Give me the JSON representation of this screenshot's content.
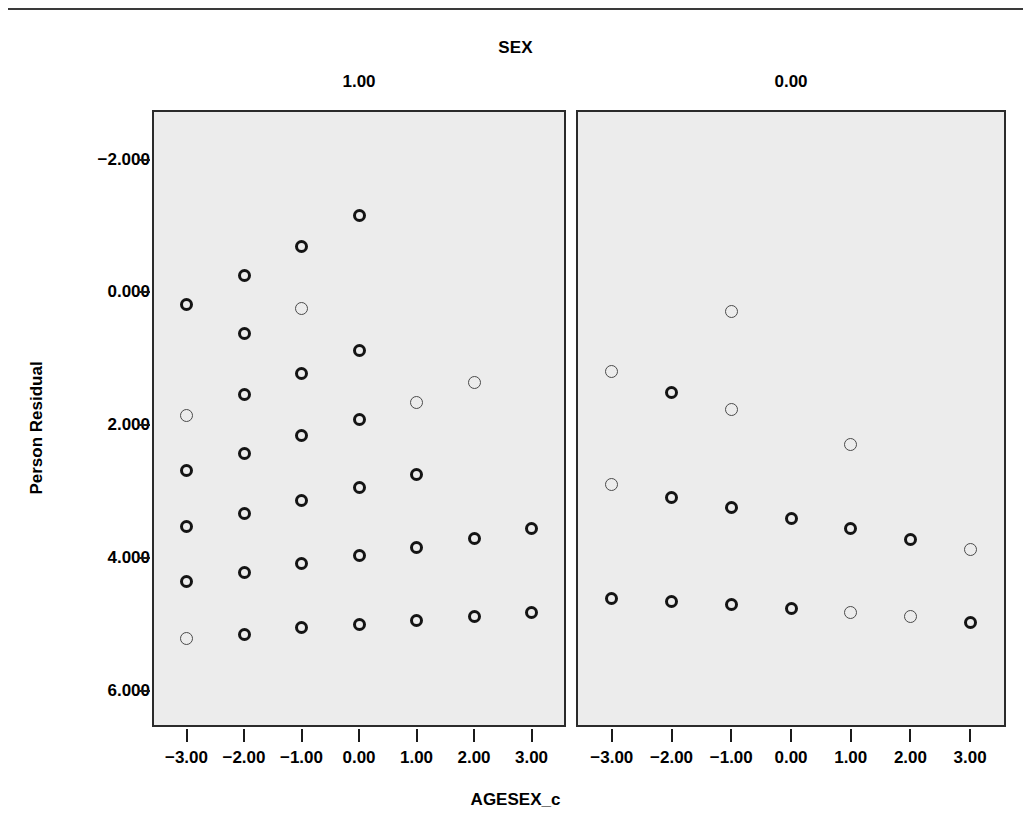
{
  "figure": {
    "title": "SEX",
    "y_axis_title": "Person Residual",
    "x_axis_title": "AGESEX_c",
    "panel_labels": [
      "1.00",
      "0.00"
    ],
    "y_tick_labels": [
      "6.000",
      "4.000",
      "2.000",
      "0.000",
      "−2.000"
    ],
    "x_tick_labels": [
      "−3.00",
      "−2.00",
      "−1.00",
      "0.00",
      "1.00",
      "2.00",
      "3.00"
    ],
    "panel_background": "#ececec",
    "marker_color": "#141414",
    "page_background": "#ffffff"
  },
  "chart_data": {
    "type": "scatter",
    "title": "SEX",
    "xlabel": "AGESEX_c",
    "ylabel": "Person Residual",
    "grid": false,
    "legend": null,
    "xlim": [
      -3.6,
      3.6
    ],
    "ylim": [
      -2.55,
      6.75
    ],
    "x_ticks": [
      -3,
      -2,
      -1,
      0,
      1,
      2,
      3
    ],
    "y_ticks": [
      -2,
      0,
      2,
      4,
      6
    ],
    "facet_variable": "SEX",
    "panels": [
      {
        "label": "1.00",
        "points": [
          {
            "x": -3,
            "y": 3.82,
            "weight": "heavy"
          },
          {
            "x": -3,
            "y": 2.14,
            "weight": "light"
          },
          {
            "x": -3,
            "y": 1.32,
            "weight": "heavy"
          },
          {
            "x": -3,
            "y": 0.47,
            "weight": "heavy"
          },
          {
            "x": -3,
            "y": -0.36,
            "weight": "heavy"
          },
          {
            "x": -3,
            "y": -1.22,
            "weight": "light"
          },
          {
            "x": -2,
            "y": 4.26,
            "weight": "heavy"
          },
          {
            "x": -2,
            "y": 3.38,
            "weight": "heavy"
          },
          {
            "x": -2,
            "y": 2.46,
            "weight": "heavy"
          },
          {
            "x": -2,
            "y": 1.57,
            "weight": "heavy"
          },
          {
            "x": -2,
            "y": 0.67,
            "weight": "heavy"
          },
          {
            "x": -2,
            "y": -0.22,
            "weight": "heavy"
          },
          {
            "x": -2,
            "y": -1.15,
            "weight": "heavy"
          },
          {
            "x": -1,
            "y": 4.69,
            "weight": "heavy"
          },
          {
            "x": -1,
            "y": 3.76,
            "weight": "light"
          },
          {
            "x": -1,
            "y": 2.78,
            "weight": "heavy"
          },
          {
            "x": -1,
            "y": 1.84,
            "weight": "heavy"
          },
          {
            "x": -1,
            "y": 0.87,
            "weight": "heavy"
          },
          {
            "x": -1,
            "y": -0.08,
            "weight": "heavy"
          },
          {
            "x": -1,
            "y": -1.05,
            "weight": "heavy"
          },
          {
            "x": 0,
            "y": 5.16,
            "weight": "heavy"
          },
          {
            "x": 0,
            "y": 3.12,
            "weight": "heavy"
          },
          {
            "x": 0,
            "y": 2.08,
            "weight": "heavy"
          },
          {
            "x": 0,
            "y": 1.06,
            "weight": "heavy"
          },
          {
            "x": 0,
            "y": 0.04,
            "weight": "heavy"
          },
          {
            "x": 0,
            "y": -1.0,
            "weight": "heavy"
          },
          {
            "x": 1,
            "y": 2.34,
            "weight": "light"
          },
          {
            "x": 1,
            "y": 1.25,
            "weight": "heavy"
          },
          {
            "x": 1,
            "y": 0.15,
            "weight": "heavy"
          },
          {
            "x": 1,
            "y": -0.95,
            "weight": "heavy"
          },
          {
            "x": 2,
            "y": 2.64,
            "weight": "light"
          },
          {
            "x": 2,
            "y": 0.29,
            "weight": "heavy"
          },
          {
            "x": 2,
            "y": -0.88,
            "weight": "heavy"
          },
          {
            "x": 3,
            "y": 0.44,
            "weight": "heavy"
          },
          {
            "x": 3,
            "y": -0.82,
            "weight": "heavy"
          }
        ]
      },
      {
        "label": "0.00",
        "points": [
          {
            "x": -3,
            "y": 2.81,
            "weight": "light"
          },
          {
            "x": -3,
            "y": 1.1,
            "weight": "light"
          },
          {
            "x": -3,
            "y": -0.62,
            "weight": "heavy"
          },
          {
            "x": -2,
            "y": 2.49,
            "weight": "heavy"
          },
          {
            "x": -2,
            "y": 0.91,
            "weight": "heavy"
          },
          {
            "x": -2,
            "y": -0.66,
            "weight": "heavy"
          },
          {
            "x": -1,
            "y": 3.72,
            "weight": "light"
          },
          {
            "x": -1,
            "y": 2.24,
            "weight": "light"
          },
          {
            "x": -1,
            "y": 0.76,
            "weight": "heavy"
          },
          {
            "x": -1,
            "y": -0.7,
            "weight": "heavy"
          },
          {
            "x": 0,
            "y": 0.6,
            "weight": "heavy"
          },
          {
            "x": 0,
            "y": -0.76,
            "weight": "heavy"
          },
          {
            "x": 1,
            "y": 1.71,
            "weight": "light"
          },
          {
            "x": 1,
            "y": 0.44,
            "weight": "heavy"
          },
          {
            "x": 1,
            "y": -0.82,
            "weight": "light"
          },
          {
            "x": 2,
            "y": 0.28,
            "weight": "heavy"
          },
          {
            "x": 2,
            "y": -0.88,
            "weight": "light"
          },
          {
            "x": 3,
            "y": 0.12,
            "weight": "light"
          },
          {
            "x": 3,
            "y": -0.97,
            "weight": "heavy"
          }
        ]
      }
    ]
  }
}
